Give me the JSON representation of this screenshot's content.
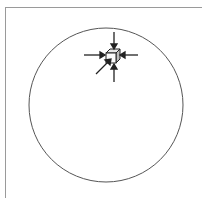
{
  "diagram": {
    "circle": {
      "cx": 106,
      "cy": 105,
      "r": 77,
      "stroke": "#555555"
    },
    "object": {
      "shape": "cube",
      "x": 114,
      "y": 55
    },
    "arrows": [
      {
        "name": "force-from-top",
        "direction": "down"
      },
      {
        "name": "force-from-left",
        "direction": "right"
      },
      {
        "name": "force-from-right",
        "direction": "left"
      },
      {
        "name": "force-from-bottom",
        "direction": "up"
      },
      {
        "name": "force-diagonal",
        "direction": "up-right"
      }
    ],
    "colors": {
      "line": "#222222",
      "frame": "#9a9a9a",
      "background": "#ffffff"
    }
  }
}
